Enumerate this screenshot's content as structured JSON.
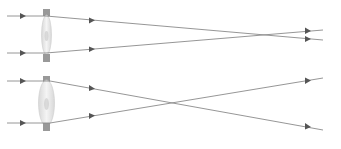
{
  "diagram": {
    "title": "",
    "colors": {
      "ray": "#8a8a8a",
      "arrow": "#555555",
      "lens_edge": "#9a9a9a",
      "lens_fill": "#e6e6e6"
    },
    "panels": [
      {
        "name": "top-lens-diagram",
        "lens": {
          "x": 46,
          "y_top": 10,
          "y_bottom": 62,
          "type": "convex-thin"
        },
        "rays": [
          {
            "points": [
              [
                7,
                16
              ],
              [
                46,
                16
              ],
              [
                323,
                40
              ]
            ]
          },
          {
            "points": [
              [
                7,
                53
              ],
              [
                46,
                53
              ],
              [
                323,
                30
              ]
            ]
          }
        ]
      },
      {
        "name": "bottom-lens-diagram",
        "lens": {
          "x": 46,
          "y_top": 76,
          "y_bottom": 131,
          "type": "convex-thick"
        },
        "rays": [
          {
            "points": [
              [
                7,
                81
              ],
              [
                50,
                81
              ],
              [
                323,
                130
              ]
            ]
          },
          {
            "points": [
              [
                7,
                123
              ],
              [
                50,
                123
              ],
              [
                323,
                78
              ]
            ]
          }
        ]
      }
    ]
  }
}
